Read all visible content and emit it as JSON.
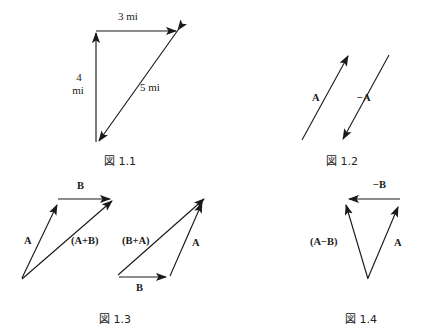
{
  "document": {
    "type": "vector-diagram-sheet",
    "background_color": "#ffffff",
    "stroke_color": "#1a1a1a",
    "width": 421,
    "height": 333
  },
  "figures": [
    {
      "id": "fig-1-1",
      "caption": "図 1.1",
      "description": "Right triangle of displacement vectors 3 mi east, 4 mi south, 5 mi resultant",
      "labels": [
        {
          "name": "label-3-mi",
          "text": "3 mi"
        },
        {
          "name": "label-4-mi-line1",
          "text": "4"
        },
        {
          "name": "label-4-mi-line2",
          "text": "mi"
        },
        {
          "name": "label-5-mi",
          "text": "5 mi"
        }
      ],
      "vectors": [
        {
          "name": "vector-3-mi",
          "label": "3 mi",
          "direction": "right"
        },
        {
          "name": "vector-4-mi",
          "label": "4 mi",
          "direction": "up"
        },
        {
          "name": "vector-5-mi",
          "label": "5 mi",
          "direction": "double"
        }
      ]
    },
    {
      "id": "fig-1-2",
      "caption": "図 1.2",
      "description": "Vector A and its negative -A, equal magnitude opposite direction",
      "labels": [
        {
          "name": "label-a",
          "text": "A"
        },
        {
          "name": "label-minus-a",
          "text": "−A"
        }
      ],
      "vectors": [
        {
          "name": "vector-a",
          "label": "A",
          "direction": "up-right"
        },
        {
          "name": "vector-minus-a",
          "label": "−A",
          "direction": "down-left"
        }
      ]
    },
    {
      "id": "fig-1-3",
      "caption": "図 1.3",
      "description": "Commutative law of vector addition: A+B equals B+A",
      "labels": [
        {
          "name": "label-b-top",
          "text": "B"
        },
        {
          "name": "label-a-left",
          "text": "A"
        },
        {
          "name": "label-a-plus-b",
          "text": "(A+B)"
        },
        {
          "name": "label-b-plus-a",
          "text": "(B+A)"
        },
        {
          "name": "label-a-right",
          "text": "A"
        },
        {
          "name": "label-b-bottom",
          "text": "B"
        }
      ],
      "vectors": [
        {
          "name": "vector-a-1",
          "label": "A",
          "direction": "up-right"
        },
        {
          "name": "vector-b-1",
          "label": "B",
          "direction": "right"
        },
        {
          "name": "vector-a-plus-b",
          "label": "(A+B)",
          "direction": "up-right"
        },
        {
          "name": "vector-b-2",
          "label": "B",
          "direction": "right"
        },
        {
          "name": "vector-a-2",
          "label": "A",
          "direction": "up-right"
        },
        {
          "name": "vector-b-plus-a",
          "label": "(B+A)",
          "direction": "up-right"
        }
      ]
    },
    {
      "id": "fig-1-4",
      "caption": "図 1.4",
      "description": "Vector subtraction: A minus B as A plus negative B",
      "labels": [
        {
          "name": "label-minus-b",
          "text": "−B"
        },
        {
          "name": "label-a-minus-b",
          "text": "(A−B)"
        },
        {
          "name": "label-a",
          "text": "A"
        }
      ],
      "vectors": [
        {
          "name": "vector-a",
          "label": "A",
          "direction": "up-right"
        },
        {
          "name": "vector-minus-b",
          "label": "−B",
          "direction": "left"
        },
        {
          "name": "vector-a-minus-b",
          "label": "(A−B)",
          "direction": "up-left"
        }
      ]
    }
  ]
}
